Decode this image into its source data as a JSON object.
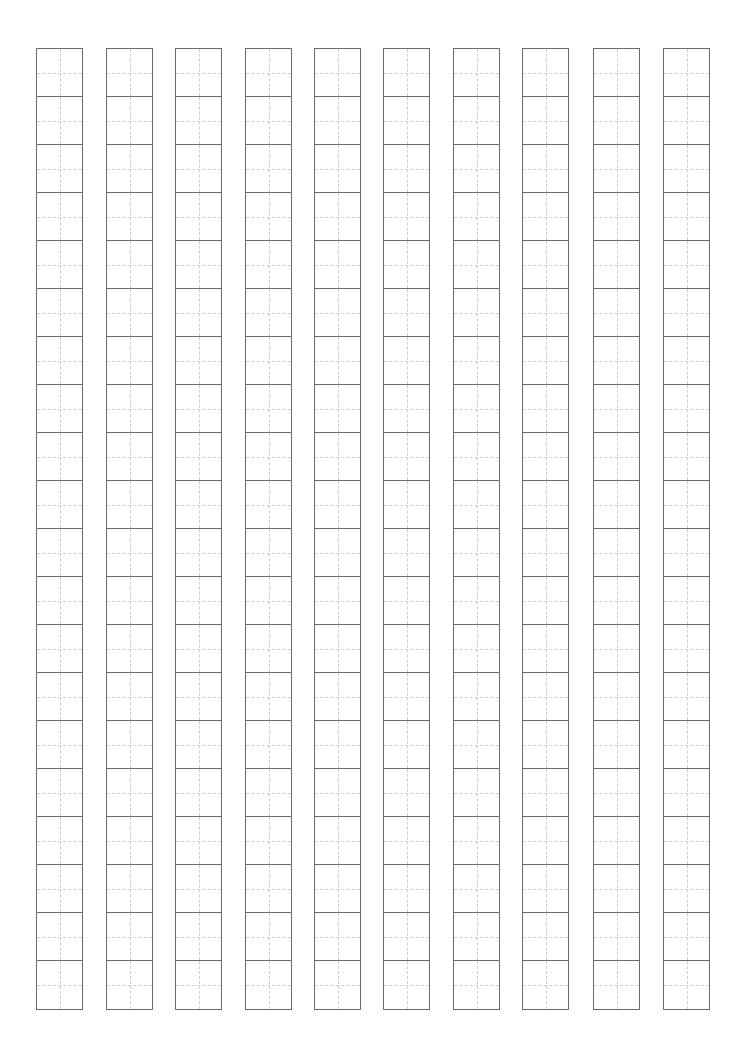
{
  "sheet": {
    "type": "tianzige-practice-grid",
    "columns": 10,
    "rows_per_column": 20,
    "column_lefts": [
      36,
      106,
      175,
      245,
      314,
      383,
      453,
      522,
      593,
      663
    ],
    "column_width": 47,
    "top": 48,
    "cell_height": 48,
    "colors": {
      "outer_line": "#6b6b6b",
      "guide_line": "#cfcfcf",
      "background": "#ffffff"
    }
  }
}
